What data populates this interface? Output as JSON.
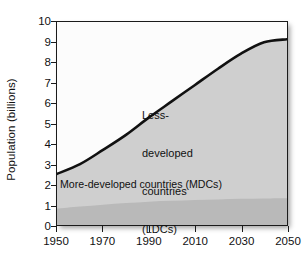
{
  "chart_data": {
    "type": "area",
    "title": "",
    "xlabel": "",
    "ylabel": "Population (billions)",
    "xlim": [
      1950,
      2050
    ],
    "ylim": [
      0,
      10
    ],
    "grid": false,
    "legend_position": "in-plot annotations",
    "x_ticks": [
      "1950",
      "1970",
      "1990",
      "2010",
      "2030",
      "2050"
    ],
    "x_tick_values": [
      1950,
      1970,
      1990,
      2010,
      2030,
      2050
    ],
    "y_ticks": [
      "0",
      "1",
      "2",
      "3",
      "4",
      "5",
      "6",
      "7",
      "8",
      "9",
      "10"
    ],
    "y_tick_values": [
      0,
      1,
      2,
      3,
      4,
      5,
      6,
      7,
      8,
      9,
      10
    ],
    "x": [
      1950,
      1960,
      1970,
      1980,
      1990,
      2000,
      2010,
      2020,
      2030,
      2040,
      2050
    ],
    "series": [
      {
        "name": "More-developed countries (MDCs)",
        "values": [
          0.81,
          0.91,
          1.0,
          1.08,
          1.15,
          1.19,
          1.23,
          1.26,
          1.29,
          1.31,
          1.32
        ],
        "color": "#b9b9b9"
      },
      {
        "name": "Less-developed countries (LDCs)",
        "values": [
          1.71,
          2.09,
          2.7,
          3.36,
          4.15,
          4.91,
          5.67,
          6.44,
          7.15,
          7.69,
          7.83
        ],
        "color": "#cfcfcf"
      }
    ],
    "total_line": {
      "name": "World total population",
      "values": [
        2.52,
        3.0,
        3.7,
        4.44,
        5.3,
        6.1,
        6.9,
        7.7,
        8.44,
        9.0,
        9.15
      ],
      "color": "#111111"
    },
    "annotations": [
      {
        "id": "ldc",
        "lines": [
          "Less-",
          "developed",
          "countries",
          "(LDCs)"
        ],
        "text": "Less-developed countries (LDCs)"
      },
      {
        "id": "mdc",
        "lines": [
          "More-developed countries (MDCs)"
        ],
        "text": "More-developed countries (MDCs)"
      }
    ],
    "colors": {
      "plot_background": "#fcfcfc",
      "ldc_fill": "#cfcfcf",
      "mdc_fill": "#b9b9b9",
      "line": "#111111",
      "axis": "#1b1b1b",
      "text": "#111111"
    }
  }
}
